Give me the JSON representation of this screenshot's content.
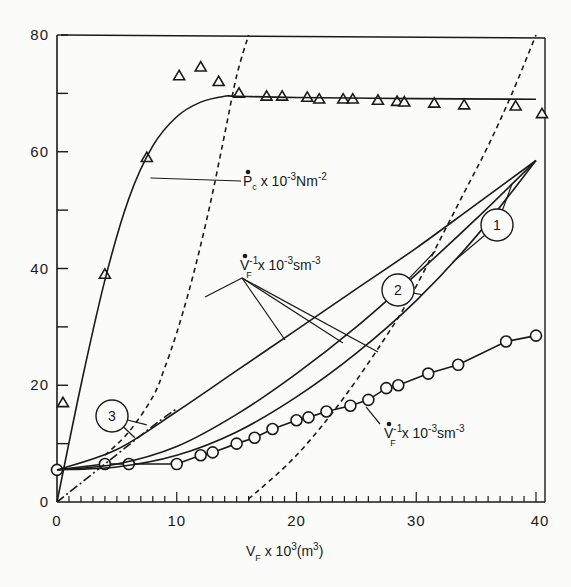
{
  "chart_data": {
    "type": "line",
    "title": "",
    "xlabel": "V_F x 10^3(m^3)",
    "ylabel": "",
    "xlim": [
      0,
      40
    ],
    "ylim": [
      0,
      80
    ],
    "grid": false,
    "x_ticks": [
      0,
      10,
      20,
      30,
      40
    ],
    "y_ticks": [
      0,
      20,
      40,
      60,
      80
    ],
    "y_tick_labels_as_printed": [
      "0",
      "20",
      "40",
      "60",
      "80"
    ],
    "x_tick_labels": [
      "0",
      "10",
      "20",
      "30",
      "40"
    ],
    "annotations": [
      {
        "id": "pc_label",
        "text": "P_c x 10^-3 Nm^-2",
        "main": "P",
        "sub": "c",
        "rest": " x 10",
        "exp": "-3",
        "unit": "Nm",
        "unit_exp": "-2"
      },
      {
        "id": "vf_label_upper",
        "text": "V_F^-1 x 10^-3 sm^-3",
        "main": "V",
        "sub": "F",
        "sup": "-1",
        "rest": " x  10",
        "exp": "-3",
        "unit": "sm",
        "unit_exp": "-3"
      },
      {
        "id": "vf_label_lower",
        "text": "V_F^-1 x 10^-3 sm^-3",
        "main": "V",
        "sub": "F",
        "sup": "-1",
        "rest": " x  10",
        "exp": "-3",
        "unit": "sm",
        "unit_exp": "-3"
      },
      {
        "id": "curve_1",
        "text": "1"
      },
      {
        "id": "curve_2",
        "text": "2"
      },
      {
        "id": "curve_3",
        "text": "3"
      }
    ],
    "series": [
      {
        "name": "P_c measured (triangles)",
        "marker": "triangle",
        "line": "none",
        "x": [
          0.5,
          4.0,
          7.5,
          10.2,
          12.0,
          13.5,
          15.2,
          17.5,
          18.8,
          20.9,
          21.9,
          23.9,
          24.7,
          26.8,
          28.4,
          29.0,
          31.5,
          34.0,
          38.3,
          40.5
        ],
        "y": [
          17,
          39,
          59,
          73,
          74.5,
          72,
          70,
          69.5,
          69.5,
          69.3,
          69,
          69,
          69,
          68.8,
          68.6,
          68.5,
          68.3,
          68,
          67.8,
          66.5
        ]
      },
      {
        "name": "P_c model (solid)",
        "marker": "none",
        "line": "solid",
        "x": [
          0,
          2,
          4,
          6,
          8,
          10,
          12,
          14,
          15,
          20,
          30,
          40
        ],
        "y": [
          0,
          20,
          38,
          52,
          61,
          66,
          68.5,
          69.5,
          69.5,
          69.3,
          69.1,
          69
        ]
      },
      {
        "name": "V_F^-1 measured (circles)",
        "marker": "circle",
        "line": "solid",
        "x": [
          0,
          4,
          6,
          10,
          12,
          13,
          15,
          16.5,
          18,
          20,
          21,
          22.5,
          24.5,
          26,
          27.5,
          28.5,
          31,
          33.5,
          37.5,
          40
        ],
        "y": [
          5.5,
          6.5,
          6.5,
          6.5,
          8,
          8.5,
          10,
          11,
          12.5,
          14,
          14.5,
          15.5,
          16.5,
          17.5,
          19.5,
          20,
          22,
          23.5,
          27.5,
          28.5
        ]
      },
      {
        "name": "Curve 1 (solid)",
        "marker": "none",
        "line": "solid",
        "x": [
          0,
          5,
          10,
          15,
          20,
          25,
          30,
          35,
          40
        ],
        "y": [
          5.5,
          6.0,
          8.0,
          12.0,
          18.0,
          25.5,
          34.5,
          45.5,
          58.5
        ]
      },
      {
        "name": "Curve 2 (solid)",
        "marker": "none",
        "line": "solid",
        "x": [
          0,
          5,
          10,
          15,
          20,
          25,
          30,
          35,
          40
        ],
        "y": [
          5.5,
          6.5,
          9.5,
          15.0,
          22.0,
          30.0,
          39.0,
          48.5,
          58.5
        ]
      },
      {
        "name": "Curve 3 (solid)",
        "marker": "none",
        "line": "solid",
        "x": [
          0,
          5,
          10,
          15,
          20,
          25,
          30,
          35,
          40
        ],
        "y": [
          5.5,
          9.0,
          15.5,
          22.5,
          29.5,
          36.5,
          43.5,
          51.0,
          58.5
        ]
      },
      {
        "name": "Dash-dot line",
        "marker": "none",
        "line": "dashdot",
        "x": [
          0,
          4,
          8,
          10
        ],
        "y": [
          0,
          6.5,
          13,
          16
        ]
      },
      {
        "name": "Dashed curve A (steep)",
        "marker": "none",
        "line": "dashed",
        "x": [
          4,
          6,
          8,
          9,
          10,
          11,
          12,
          13,
          14,
          15,
          16
        ],
        "y": [
          8,
          12,
          18,
          23,
          29,
          36,
          44,
          53,
          63,
          73,
          80
        ]
      },
      {
        "name": "Dashed curve B",
        "marker": "none",
        "line": "dashed",
        "x": [
          16,
          20,
          24,
          28,
          30,
          32,
          34,
          36,
          38,
          40
        ],
        "y": [
          0.5,
          8,
          18,
          30,
          37,
          45,
          53,
          61,
          70,
          80
        ]
      }
    ]
  },
  "layout": {
    "plot": {
      "left": 57,
      "top": 35,
      "right": 536,
      "bottom": 502
    },
    "colors": {
      "ink": "#1a1a1a",
      "background": "#fbfbf9"
    },
    "xlabel_pos": {
      "x": 246,
      "y": 556
    },
    "pc_label_pos": {
      "x": 243,
      "y": 186
    },
    "vf_upper_label_pos": {
      "x": 240,
      "y": 270
    },
    "vf_lower_label_pos": {
      "x": 384,
      "y": 438
    },
    "circle_labels": [
      {
        "text": "1",
        "x": 497,
        "y": 225
      },
      {
        "text": "2",
        "x": 398,
        "y": 290
      },
      {
        "text": "3",
        "x": 112,
        "y": 416
      }
    ]
  }
}
